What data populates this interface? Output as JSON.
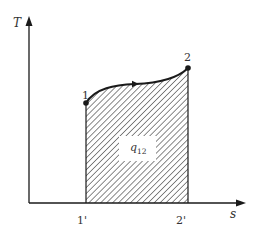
{
  "diagram": {
    "type": "T-s diagram",
    "axes": {
      "y_label": "T",
      "x_label": "s"
    },
    "points": [
      {
        "id": "1",
        "label": "1"
      },
      {
        "id": "2",
        "label": "2"
      }
    ],
    "ticks": [
      {
        "id": "1prime",
        "label": "1'"
      },
      {
        "id": "2prime",
        "label": "2'"
      }
    ],
    "area_label": {
      "main": "q",
      "subscript": "12"
    },
    "colors": {
      "line": "#1a1a1a",
      "hatch": "#333333",
      "text": "#333333",
      "background": "#ffffff"
    }
  }
}
